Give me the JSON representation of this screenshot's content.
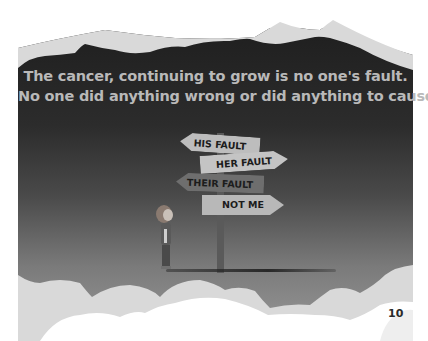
{
  "page": {
    "caption_lines": [
      "The cancer, continuing to grow is no one's fault.",
      "No one did anything wrong or did anything to cause it."
    ],
    "signs": [
      {
        "label": "HIS FAULT",
        "direction": "left"
      },
      {
        "label": "HER FAULT",
        "direction": "right"
      },
      {
        "label": "THEIR FAULT",
        "direction": "left"
      },
      {
        "label": "NOT ME",
        "direction": "right"
      }
    ],
    "page_number": "10"
  },
  "colors": {
    "sky_dark": "#1f1f1f",
    "sky_light": "#8c8c8c",
    "cloud_back": "#d9d9d9",
    "cloud_front": "#ffffff",
    "caption_text": "#b9b9b9",
    "sign_fill": "#bdbdbd",
    "sign_text": "#1c1c1c"
  }
}
